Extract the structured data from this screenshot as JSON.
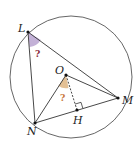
{
  "diagram": {
    "type": "geometry",
    "points": {
      "L": "L",
      "M": "M",
      "N": "N",
      "O": "O",
      "H": "H"
    },
    "angle_marks": [
      {
        "vertex": "L",
        "label": "?",
        "color": "#b9a3d0",
        "text_color": "#8b2a3a"
      },
      {
        "vertex": "O",
        "label": "?",
        "color": "#e0b98a",
        "text_color": "#c8763a"
      }
    ],
    "colors": {
      "stroke": "#333333",
      "circle": "#555555",
      "dashed": "#333333"
    }
  }
}
